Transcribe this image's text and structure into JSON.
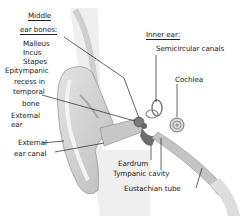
{
  "diagram": {
    "middle_ear": {
      "heading_line1": "Middle",
      "heading_line2": "ear bones:",
      "items": [
        "Malleus",
        "Incus",
        "Stapes"
      ],
      "recess_lines": [
        "Epitympanic",
        "recess in",
        "temporal",
        "bone"
      ]
    },
    "inner_ear": {
      "heading": "Inner ear:",
      "items": [
        "Semicircular canals",
        "Cochlea"
      ]
    },
    "external": {
      "ear_lines": [
        "External",
        "ear"
      ],
      "canal_lines": [
        "External",
        "ear canal"
      ]
    },
    "bottom_labels": [
      "Eardrum",
      "Tympanic cavity",
      "Eustachian tube"
    ]
  }
}
